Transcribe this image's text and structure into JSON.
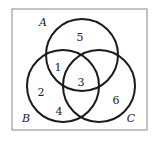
{
  "diagram": {
    "type": "venn",
    "sets": [
      {
        "label": "A",
        "cx": 82,
        "cy": 55,
        "r": 36,
        "label_x": 43,
        "label_y": 26
      },
      {
        "label": "B",
        "cx": 63,
        "cy": 86,
        "r": 36,
        "label_x": 26,
        "label_y": 122
      },
      {
        "label": "C",
        "cx": 99,
        "cy": 86,
        "r": 36,
        "label_x": 131,
        "label_y": 122
      }
    ],
    "regions": [
      {
        "value": "5",
        "x": 80,
        "y": 38
      },
      {
        "value": "1",
        "x": 58,
        "y": 68
      },
      {
        "value": "3",
        "x": 81,
        "y": 83
      },
      {
        "value": "2",
        "x": 41,
        "y": 93
      },
      {
        "value": "4",
        "x": 59,
        "y": 112
      },
      {
        "value": "6",
        "x": 116,
        "y": 101
      }
    ],
    "frame": {
      "x": 12,
      "y": 9,
      "w": 135,
      "h": 121
    },
    "stroke_color": "#1a1a1a",
    "frame_color": "#888888"
  }
}
